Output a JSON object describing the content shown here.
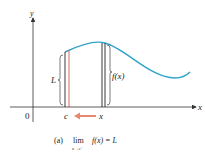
{
  "diagram": {
    "axes": {
      "x_label": "x",
      "y_label": "y",
      "origin_label": "0"
    },
    "labels": {
      "c": "c",
      "x": "x",
      "L": "L",
      "fx": "f(x)"
    },
    "caption": {
      "part": "(a)",
      "lim": "lim",
      "sub": "x→c⁺",
      "expr": "f(x) = L"
    },
    "colors": {
      "curve": "#2fa3c8",
      "red_line": "#d9534f",
      "arrow": "#e8886f",
      "axis": "#333333"
    }
  }
}
